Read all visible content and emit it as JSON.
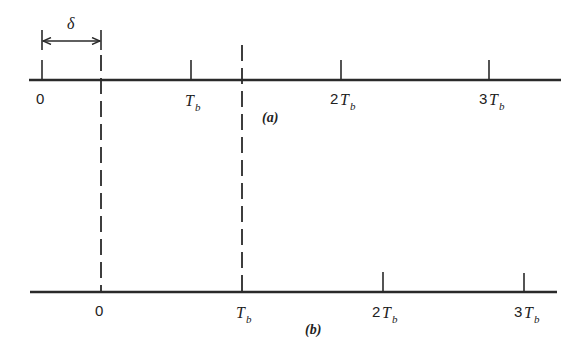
{
  "diagram": {
    "delta_label": "δ",
    "axis_a": {
      "caption": "(a)",
      "ticks": [
        {
          "num": "0",
          "sym": "",
          "sub": ""
        },
        {
          "num": "",
          "sym": "T",
          "sub": "b"
        },
        {
          "num": "2",
          "sym": "T",
          "sub": "b"
        },
        {
          "num": "3",
          "sym": "T",
          "sub": "b"
        }
      ]
    },
    "axis_b": {
      "caption": "(b)",
      "ticks": [
        {
          "num": "0",
          "sym": "",
          "sub": ""
        },
        {
          "num": "",
          "sym": "T",
          "sub": "b"
        },
        {
          "num": "2",
          "sym": "T",
          "sub": "b"
        },
        {
          "num": "3",
          "sym": "T",
          "sub": "b"
        }
      ]
    }
  }
}
